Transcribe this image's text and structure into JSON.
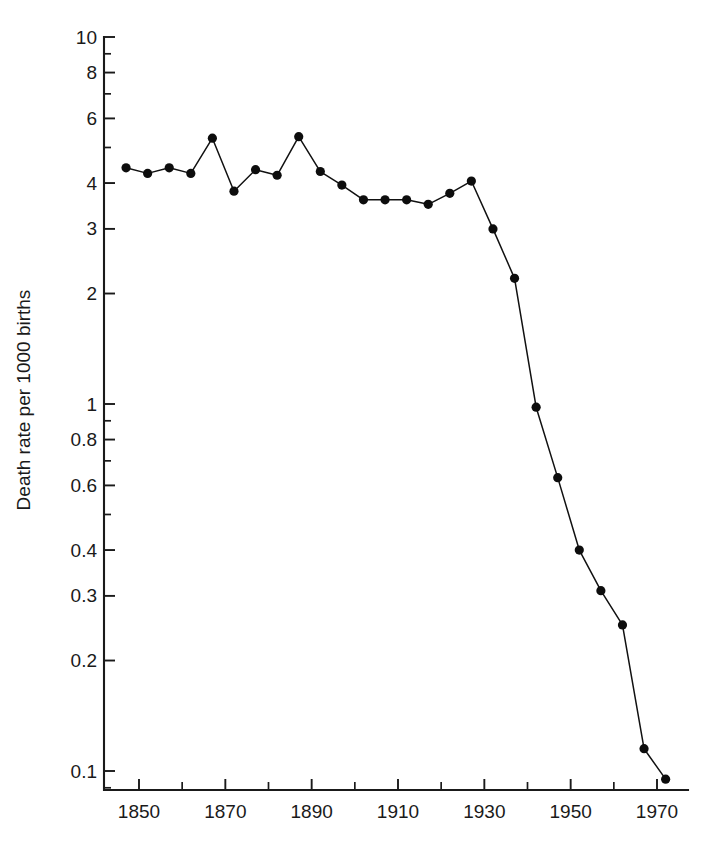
{
  "chart_data": {
    "type": "line",
    "title": "",
    "xlabel": "",
    "ylabel": "Death rate per 1000 births",
    "yscale": "log",
    "xscale": "linear",
    "xlim": [
      1843,
      1977
    ],
    "ylim": [
      0.08,
      10
    ],
    "grid": false,
    "legend": null,
    "y_tick_labels": [
      "10",
      "8",
      "6",
      "4",
      "3",
      "2",
      "1",
      "0.8",
      "0.6",
      "0.4",
      "0.3",
      "0.2",
      "0.1"
    ],
    "y_tick_values": [
      10,
      8,
      6,
      4,
      3,
      2,
      1,
      0.8,
      0.6,
      0.4,
      0.3,
      0.2,
      0.1
    ],
    "y_minor_tick_values": [
      9,
      7,
      5,
      0.9,
      0.7,
      0.5,
      0.09
    ],
    "x_tick_labels": [
      "1850",
      "1870",
      "1890",
      "1910",
      "1930",
      "1950",
      "1970"
    ],
    "x_tick_values": [
      1850,
      1870,
      1890,
      1910,
      1930,
      1950,
      1970
    ],
    "x_minor_tick_values": [
      1860,
      1880,
      1900,
      1920,
      1940,
      1960
    ],
    "series": [
      {
        "name": "Death rate per 1000 births",
        "marker": "filled-circle",
        "color": "#0d0d0d",
        "x": [
          1847,
          1852,
          1857,
          1862,
          1867,
          1872,
          1877,
          1882,
          1887,
          1892,
          1897,
          1902,
          1907,
          1912,
          1917,
          1922,
          1927,
          1932,
          1937,
          1942,
          1947,
          1952,
          1957,
          1962,
          1967,
          1972
        ],
        "y": [
          4.4,
          4.25,
          4.4,
          4.25,
          5.3,
          3.8,
          4.35,
          4.2,
          5.35,
          4.3,
          3.95,
          3.6,
          3.6,
          3.6,
          3.5,
          3.75,
          4.05,
          3.0,
          2.2,
          0.98,
          0.63,
          0.4,
          0.31,
          0.25,
          0.115,
          0.095
        ]
      }
    ]
  }
}
